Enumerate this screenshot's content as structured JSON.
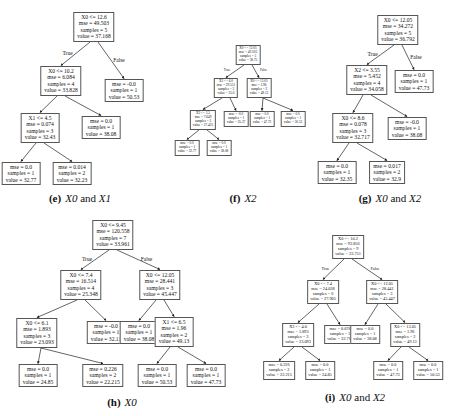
{
  "figures": [
    {
      "id": "e",
      "caption_tag": "(e)",
      "caption_text": "X0 and X1",
      "size": "md",
      "caption_pos": [
        80,
        192
      ],
      "nodes": [
        {
          "id": "root",
          "x": 94,
          "y": 12,
          "lines": [
            "X0 <= 12.6",
            "mse = 49.503",
            "samples = 5",
            "value = 37.168"
          ]
        },
        {
          "id": "L",
          "x": 61,
          "y": 66,
          "lines": [
            "X0 <= 10.2",
            "mse = 6.084",
            "samples = 4",
            "value = 33.828"
          ],
          "parent": "root",
          "label": "True"
        },
        {
          "id": "R",
          "x": 124,
          "y": 79,
          "lines": [
            "mse = -0.0",
            "samples = 1",
            "value = 50.53"
          ],
          "parent": "root",
          "label": "False"
        },
        {
          "id": "LL",
          "x": 40,
          "y": 113,
          "lines": [
            "X1 <= 4.5",
            "mse = 0.074",
            "samples = 3",
            "value = 32.43"
          ],
          "parent": "L"
        },
        {
          "id": "LR",
          "x": 101,
          "y": 116,
          "lines": [
            "mse = 0.0",
            "samples = 1",
            "value = 38.08"
          ],
          "parent": "L"
        },
        {
          "id": "LLL",
          "x": 21,
          "y": 162,
          "lines": [
            "mse = 0.0",
            "samples = 1",
            "value = 32.77"
          ],
          "parent": "LL"
        },
        {
          "id": "LLR",
          "x": 72,
          "y": 162,
          "lines": [
            "mse = 0.014",
            "samples = 2",
            "value = 32.23"
          ],
          "parent": "LL"
        }
      ]
    },
    {
      "id": "f",
      "caption_tag": "(f)",
      "caption_text": "X2",
      "size": "sm",
      "caption_pos": [
        243,
        192
      ],
      "nodes": [
        {
          "id": "root",
          "x": 248,
          "y": 45,
          "lines": [
            "X0 <= 12.05",
            "mse = 49.503",
            "samples = 5",
            "value = 38.75"
          ]
        },
        {
          "id": "L",
          "x": 226,
          "y": 78,
          "lines": [
            "X2 <= 6.0",
            "mse = 29.551",
            "samples = 3",
            "value = 35.0"
          ],
          "parent": "root",
          "label": "True"
        },
        {
          "id": "R",
          "x": 259,
          "y": 78,
          "lines": [
            "X0 <= 13.05",
            "mse = 3.96",
            "samples = 2",
            "value = 49.13"
          ],
          "parent": "root",
          "label": "False"
        },
        {
          "id": "LL",
          "x": 203,
          "y": 110,
          "lines": [
            "X2 <= 3.5",
            "mse = 7.649",
            "samples = 2",
            "value = 37.425"
          ],
          "parent": "L"
        },
        {
          "id": "LR",
          "x": 236,
          "y": 111,
          "lines": [
            "mse = -0.0",
            "samples = 1",
            "value = 25.37"
          ],
          "parent": "L"
        },
        {
          "id": "RL",
          "x": 262,
          "y": 111,
          "lines": [
            "mse = 0.0",
            "samples = 1",
            "value = 47.73"
          ],
          "parent": "R"
        },
        {
          "id": "RR",
          "x": 293,
          "y": 111,
          "lines": [
            "mse = 0.0",
            "samples = 1",
            "value = 50.53"
          ],
          "parent": "R"
        },
        {
          "id": "LLL",
          "x": 187,
          "y": 140,
          "lines": [
            "mse = 0.0",
            "samples = 1",
            "value = 32.77"
          ],
          "parent": "LL"
        },
        {
          "id": "LLR",
          "x": 219,
          "y": 140,
          "lines": [
            "mse = 0.0",
            "samples = 1",
            "value = 38.08"
          ],
          "parent": "LL"
        }
      ]
    },
    {
      "id": "g",
      "caption_tag": "(g)",
      "caption_text": "X0 and X2",
      "size": "md",
      "caption_pos": [
        390,
        192
      ],
      "nodes": [
        {
          "id": "root",
          "x": 398,
          "y": 15,
          "lines": [
            "X0 <= 12.05",
            "mse = 34.272",
            "samples = 5",
            "value = 36.792"
          ]
        },
        {
          "id": "L",
          "x": 367,
          "y": 65,
          "lines": [
            "X2 <= 3.55",
            "mse = 5.452",
            "samples = 4",
            "value = 34.058"
          ],
          "parent": "root",
          "label": "True"
        },
        {
          "id": "R",
          "x": 414,
          "y": 70,
          "lines": [
            "mse = 0.0",
            "samples = 1",
            "value = 47.73"
          ],
          "parent": "root",
          "label": "False"
        },
        {
          "id": "LL",
          "x": 353,
          "y": 113,
          "lines": [
            "X0 <= 8.6",
            "mse = 0.078",
            "samples = 3",
            "value = 32.717"
          ],
          "parent": "L"
        },
        {
          "id": "LR",
          "x": 407,
          "y": 117,
          "lines": [
            "mse = -0.0",
            "samples = 1",
            "value = 38.08"
          ],
          "parent": "L"
        },
        {
          "id": "LLL",
          "x": 337,
          "y": 161,
          "lines": [
            "mse = 0.0",
            "samples = 1",
            "value = 32.35"
          ],
          "parent": "LL"
        },
        {
          "id": "LLR",
          "x": 387,
          "y": 161,
          "lines": [
            "mse = 0.017",
            "samples = 2",
            "value = 32.9"
          ],
          "parent": "LL"
        }
      ]
    },
    {
      "id": "h",
      "caption_tag": "(h)",
      "caption_text": "X0",
      "size": "md",
      "caption_pos": [
        122,
        396
      ],
      "nodes": [
        {
          "id": "root",
          "x": 113,
          "y": 220,
          "lines": [
            "X0 <= 9.45",
            "mse = 120.558",
            "samples = 7",
            "value = 33.961"
          ]
        },
        {
          "id": "L",
          "x": 81,
          "y": 270,
          "lines": [
            "X0 <= 7.4",
            "mse = 16.514",
            "samples = 4",
            "value = 25.348"
          ],
          "parent": "root",
          "label": "True"
        },
        {
          "id": "R",
          "x": 160,
          "y": 270,
          "lines": [
            "X0 <= 12.05",
            "mse = 28.441",
            "samples = 3",
            "value = 45.447"
          ],
          "parent": "root",
          "label": "False"
        },
        {
          "id": "LL",
          "x": 37,
          "y": 318,
          "lines": [
            "X0 <= 6.1",
            "mse = 1.893",
            "samples = 3",
            "value = 23.093"
          ],
          "parent": "L"
        },
        {
          "id": "LR",
          "x": 106,
          "y": 321,
          "lines": [
            "mse = -0.0",
            "samples = 1",
            "value = 32.11"
          ],
          "parent": "L"
        },
        {
          "id": "RL",
          "x": 139,
          "y": 321,
          "lines": [
            "mse = 0.0",
            "samples = 1",
            "value = 38.08"
          ],
          "parent": "R"
        },
        {
          "id": "RR",
          "x": 174,
          "y": 317,
          "lines": [
            "X1 <= 6.5",
            "mse = 1.96",
            "samples = 2",
            "value = 49.13"
          ],
          "parent": "R"
        },
        {
          "id": "LLL",
          "x": 38,
          "y": 364,
          "lines": [
            "mse = 0.0",
            "samples = 1",
            "value = 24.85"
          ],
          "parent": "LL"
        },
        {
          "id": "LLR",
          "x": 103,
          "y": 364,
          "lines": [
            "mse = 0.226",
            "samples = 2",
            "value = 22.215"
          ],
          "parent": "LL"
        },
        {
          "id": "RRL",
          "x": 157,
          "y": 364,
          "lines": [
            "mse = 0.0",
            "samples = 1",
            "value = 50.53"
          ],
          "parent": "RR"
        },
        {
          "id": "RRR",
          "x": 206,
          "y": 364,
          "lines": [
            "mse = 0.0",
            "samples = 1",
            "value = 47.73"
          ],
          "parent": "RR"
        }
      ]
    },
    {
      "id": "i",
      "caption_tag": "(i)",
      "caption_text": "X0 and X2",
      "size": "sm2",
      "caption_pos": [
        355,
        391
      ],
      "nodes": [
        {
          "id": "root",
          "x": 348,
          "y": 235,
          "lines": [
            "X0 <= 10.2",
            "mse = 93.856",
            "samples = 9",
            "value = 33.751"
          ]
        },
        {
          "id": "L",
          "x": 323,
          "y": 280,
          "lines": [
            "X0 <= 7.4",
            "mse = 24.038",
            "samples = 6",
            "value = 27.905"
          ],
          "parent": "root",
          "label": "True"
        },
        {
          "id": "R",
          "x": 382,
          "y": 280,
          "lines": [
            "X0 <= 12.05",
            "mse = 28.441",
            "samples = 3",
            "value = 45.447"
          ],
          "parent": "root",
          "label": "False"
        },
        {
          "id": "LL",
          "x": 298,
          "y": 323,
          "lines": [
            "X2 <= 4.0",
            "mse = 1.893",
            "samples = 3",
            "value = 23.093"
          ],
          "parent": "L"
        },
        {
          "id": "LR",
          "x": 340,
          "y": 325,
          "lines": [
            "mse = 0.078",
            "samples = 3",
            "value = 32.717"
          ],
          "parent": "L"
        },
        {
          "id": "RL",
          "x": 365,
          "y": 325,
          "lines": [
            "mse = 0.0",
            "samples = 1",
            "value = 38.08"
          ],
          "parent": "R"
        },
        {
          "id": "RR",
          "x": 405,
          "y": 323,
          "lines": [
            "X0 <= 13.05",
            "mse = 1.96",
            "samples = 2",
            "value = 49.13"
          ],
          "parent": "R"
        },
        {
          "id": "LLL",
          "x": 279,
          "y": 361,
          "lines": [
            "mse = 0.226",
            "samples = 2",
            "value = 22.215"
          ],
          "parent": "LL"
        },
        {
          "id": "LLR",
          "x": 320,
          "y": 361,
          "lines": [
            "mse = 0.0",
            "samples = 1",
            "value = 24.85"
          ],
          "parent": "LL"
        },
        {
          "id": "RRL",
          "x": 388,
          "y": 361,
          "lines": [
            "mse = 0.0",
            "samples = 1",
            "value = 47.73"
          ],
          "parent": "RR"
        },
        {
          "id": "RRR",
          "x": 428,
          "y": 361,
          "lines": [
            "mse = 0.0",
            "samples = 1",
            "value = 50.53"
          ],
          "parent": "RR"
        }
      ]
    }
  ]
}
